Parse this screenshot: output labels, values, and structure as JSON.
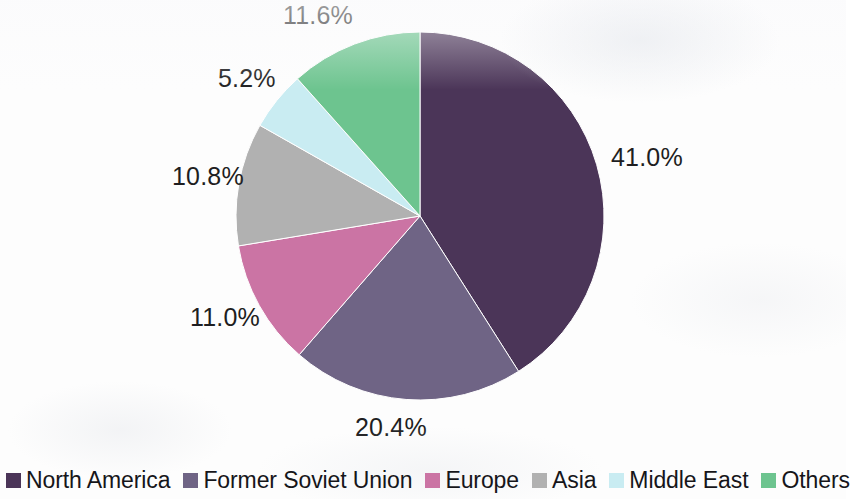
{
  "chart_data": {
    "type": "pie",
    "title": "",
    "subtitle": "",
    "xlabel": "",
    "ylabel": "",
    "grid": false,
    "legend_position": "bottom",
    "start_angle_deg": 0,
    "direction": "clockwise",
    "categories": [
      "North America",
      "Former Soviet Union",
      "Europe",
      "Asia",
      "Middle East",
      "Others"
    ],
    "values": [
      41.0,
      20.4,
      11.0,
      10.8,
      5.2,
      11.6
    ],
    "data_labels": [
      "41.0%",
      "20.4%",
      "11.0%",
      "10.8%",
      "5.2%",
      "11.6%"
    ],
    "colors": [
      "#4b3558",
      "#6f6485",
      "#cb74a4",
      "#b1b1b1",
      "#c9ecf2",
      "#6dc48f"
    ],
    "slices": [
      {
        "label": "North America",
        "value": 41.0,
        "data_label": "41.0%",
        "color": "#4b3558"
      },
      {
        "label": "Former Soviet Union",
        "value": 20.4,
        "data_label": "20.4%",
        "color": "#6f6485"
      },
      {
        "label": "Europe",
        "value": 11.0,
        "data_label": "11.0%",
        "color": "#cb74a4"
      },
      {
        "label": "Asia",
        "value": 10.8,
        "data_label": "10.8%",
        "color": "#b1b1b1"
      },
      {
        "label": "Middle East",
        "value": 5.2,
        "data_label": "5.2%",
        "color": "#c9ecf2"
      },
      {
        "label": "Others",
        "value": 11.6,
        "data_label": "11.6%",
        "color": "#6dc48f"
      }
    ]
  },
  "pie": {
    "center_x": 420,
    "center_y": 216,
    "radius": 184,
    "labels": [
      {
        "text": "41.0%",
        "left": 611,
        "top": 143
      },
      {
        "text": "20.4%",
        "left": 355,
        "top": 413
      },
      {
        "text": "11.0%",
        "left": 190,
        "top": 303
      },
      {
        "text": "10.8%",
        "left": 172,
        "top": 162
      },
      {
        "text": "5.2%",
        "left": 218,
        "top": 64
      },
      {
        "text": "11.6%",
        "left": 283,
        "top": 1
      }
    ]
  },
  "legend": {
    "items": [
      {
        "label": "North America",
        "color": "#4b3558"
      },
      {
        "label": "Former Soviet Union",
        "color": "#6f6485"
      },
      {
        "label": "Europe",
        "color": "#cb74a4"
      },
      {
        "label": "Asia",
        "color": "#b1b1b1"
      },
      {
        "label": "Middle East",
        "color": "#c9ecf2"
      },
      {
        "label": "Others",
        "color": "#6dc48f"
      }
    ]
  }
}
